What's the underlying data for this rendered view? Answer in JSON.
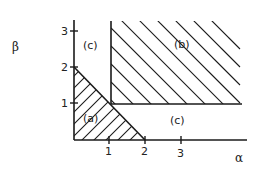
{
  "figure": {
    "type": "region-diagram",
    "axes": {
      "x_label": "α",
      "y_label": "β",
      "x_ticks": [
        "1",
        "2",
        "3"
      ],
      "y_ticks": [
        "1",
        "2",
        "3"
      ]
    },
    "regions": [
      {
        "id": "a",
        "label": "(a)",
        "description": "triangle bounded by α=0, β=0 and α+β=2",
        "hatch": "lower-left to upper-right"
      },
      {
        "id": "b",
        "label": "(b)",
        "description": "α ≥ 1 and β ≥ 1",
        "hatch": "upper-left to lower-right"
      },
      {
        "id": "c_upper",
        "label": "(c)",
        "description": "region above α+β=2 with α < 1"
      },
      {
        "id": "c_lower",
        "label": "(c)",
        "description": "region above α+β=2 with β < 1"
      }
    ],
    "colors": {
      "line": "#1a1a1a",
      "background": "#ffffff"
    }
  }
}
